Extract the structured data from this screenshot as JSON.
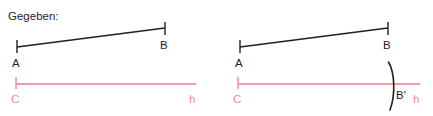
{
  "figure": {
    "caption": "Gegeben:",
    "colors": {
      "ink": "#231f20",
      "baseline_pink": "#f29aa8",
      "label_pink": "#ef8a9b",
      "background": "#ffffff"
    },
    "panels": [
      {
        "id": "given",
        "name": "gegeben-panel",
        "segment": {
          "label_start": "A",
          "label_end": "B",
          "start": {
            "x": 17,
            "y": 47
          },
          "end": {
            "x": 165,
            "y": 28
          }
        },
        "baseline": {
          "label_start": "C",
          "label_end": "h",
          "start": {
            "x": 16,
            "y": 84
          },
          "end": {
            "x": 196,
            "y": 84
          }
        },
        "arc": null
      },
      {
        "id": "construction",
        "name": "konstruktion-panel",
        "segment": {
          "label_start": "A",
          "label_end": "B",
          "start": {
            "x": 240,
            "y": 47
          },
          "end": {
            "x": 388,
            "y": 28
          }
        },
        "baseline": {
          "label_start": "C",
          "label_end": "h",
          "start": {
            "x": 238,
            "y": 84
          },
          "end": {
            "x": 420,
            "y": 84
          }
        },
        "arc": {
          "label": "B'",
          "intersection": {
            "x": 392,
            "y": 84
          },
          "top": {
            "x": 388,
            "y": 62
          },
          "bottom": {
            "x": 390,
            "y": 110
          }
        }
      }
    ],
    "labels": {
      "point_a": "A",
      "point_b": "B",
      "point_c": "C",
      "point_b_prime": "B'",
      "line_h": "h"
    }
  }
}
